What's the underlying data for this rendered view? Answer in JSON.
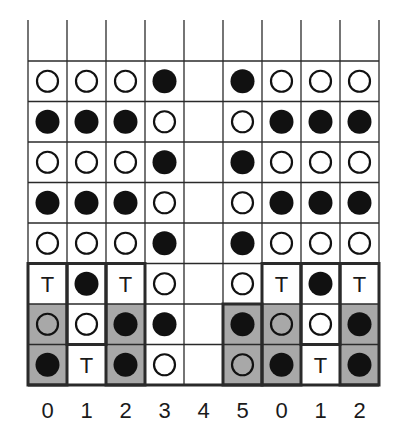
{
  "diagram": {
    "columns": [
      "0",
      "1",
      "2",
      "3",
      "4",
      "5",
      "0",
      "1",
      "2"
    ],
    "legend": {
      "O": "hollow circle",
      "X": "filled circle",
      "T": "letter T",
      "_": "empty"
    },
    "rows": [
      [
        "O",
        "O",
        "O",
        "X",
        "_",
        "X",
        "O",
        "O",
        "O"
      ],
      [
        "X",
        "X",
        "X",
        "O",
        "_",
        "O",
        "X",
        "X",
        "X"
      ],
      [
        "O",
        "O",
        "O",
        "X",
        "_",
        "X",
        "O",
        "O",
        "O"
      ],
      [
        "X",
        "X",
        "X",
        "O",
        "_",
        "O",
        "X",
        "X",
        "X"
      ],
      [
        "O",
        "O",
        "O",
        "X",
        "_",
        "X",
        "O",
        "O",
        "O"
      ],
      [
        "T",
        "X",
        "T",
        "O",
        "_",
        "O",
        "T",
        "X",
        "T"
      ],
      [
        "O",
        "O",
        "X",
        "X",
        "_",
        "X",
        "O",
        "O",
        "X"
      ],
      [
        "X",
        "T",
        "X",
        "O",
        "_",
        "O",
        "X",
        "T",
        "X"
      ]
    ],
    "shaded_cells": [
      [
        6,
        0
      ],
      [
        6,
        2
      ],
      [
        6,
        5
      ],
      [
        6,
        6
      ],
      [
        6,
        8
      ],
      [
        7,
        0
      ],
      [
        7,
        2
      ],
      [
        7,
        5
      ],
      [
        7,
        6
      ],
      [
        7,
        8
      ]
    ],
    "thick_boxes": [
      {
        "col": 0,
        "row_start": 5,
        "row_end": 7
      },
      {
        "col": 1,
        "row_start": 5,
        "row_end": 6
      },
      {
        "col": 2,
        "row_start": 5,
        "row_end": 7
      },
      {
        "col": 5,
        "row_start": 6,
        "row_end": 7
      },
      {
        "col": 6,
        "row_start": 5,
        "row_end": 7
      },
      {
        "col": 7,
        "row_start": 5,
        "row_end": 6
      },
      {
        "col": 8,
        "row_start": 5,
        "row_end": 7
      }
    ],
    "colors": {
      "line": "#2a2a2a",
      "shade": "#a8a8a8",
      "fill": "#111111",
      "background": "#ffffff"
    }
  }
}
